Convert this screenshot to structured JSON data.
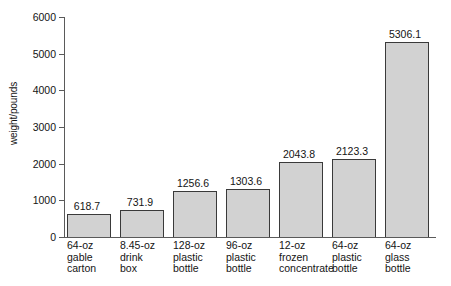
{
  "chart_data": {
    "type": "bar",
    "title": "",
    "xlabel": "",
    "ylabel": "weight/pounds",
    "ylim": [
      0,
      6000
    ],
    "ytick_step": 1000,
    "grid": false,
    "legend": false,
    "bar_fill_color": "#d2d2d2",
    "bar_edge_color": "#3a3a3a",
    "axis_color": "#5a5a5a",
    "yticks": [
      "0",
      "1000",
      "2000",
      "3000",
      "4000",
      "5000",
      "6000"
    ],
    "categories": [
      "64-oz gable carton",
      "8.45-oz drink box",
      "128-oz plastic bottle",
      "96-oz plastic bottle",
      "12-oz frozen concentrate",
      "64-oz plastic bottle",
      "64-oz glass bottle"
    ],
    "category_lines": [
      [
        "64-oz",
        "gable",
        "carton"
      ],
      [
        "8.45-oz",
        "drink",
        "box"
      ],
      [
        "128-oz",
        "plastic",
        "bottle"
      ],
      [
        "96-oz",
        "plastic",
        "bottle"
      ],
      [
        "12-oz",
        "frozen",
        "concentrate"
      ],
      [
        "64-oz",
        "plastic",
        "bottle"
      ],
      [
        "64-oz",
        "glass",
        "bottle"
      ]
    ],
    "values": [
      618.7,
      731.9,
      1256.6,
      1303.6,
      2043.8,
      2123.3,
      5306.1
    ],
    "value_labels": [
      "618.7",
      "731.9",
      "1256.6",
      "1303.6",
      "2043.8",
      "2123.3",
      "5306.1"
    ]
  }
}
